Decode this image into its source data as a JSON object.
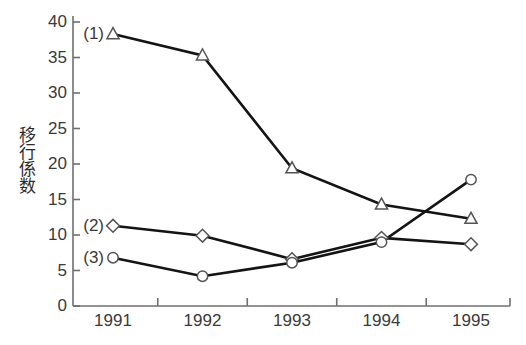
{
  "chart_data": {
    "type": "line",
    "title": "",
    "xlabel": "",
    "ylabel": "移行係数",
    "categories": [
      "1991",
      "1992",
      "1993",
      "1994",
      "1995"
    ],
    "ylim": [
      0,
      40
    ],
    "yticks": [
      0,
      5,
      10,
      15,
      20,
      25,
      30,
      35,
      40
    ],
    "ytick_labels": [
      "0",
      "5",
      "10",
      "15",
      "20",
      "25",
      "30",
      "35",
      "40"
    ],
    "grid": false,
    "legend_position": "inline-left",
    "series": [
      {
        "name": "(1)",
        "marker": "triangle",
        "values": [
          38.3,
          35.3,
          19.4,
          14.3,
          12.3
        ]
      },
      {
        "name": "(2)",
        "marker": "diamond",
        "values": [
          11.3,
          9.9,
          6.6,
          9.6,
          8.7
        ]
      },
      {
        "name": "(3)",
        "marker": "circle",
        "values": [
          6.8,
          4.2,
          6.1,
          9.0,
          17.8
        ]
      }
    ],
    "annotations": [
      {
        "text": "(1)",
        "series": "(1)",
        "at_category": "1991"
      },
      {
        "text": "(2)",
        "series": "(2)",
        "at_category": "1991"
      },
      {
        "text": "(3)",
        "series": "(3)",
        "at_category": "1991"
      }
    ],
    "colors": {
      "line": "#141414",
      "marker_fill": "#ffffff",
      "marker_stroke": "#555555",
      "axis": "#6f6f6f",
      "text": "#3a3a3a",
      "background": "#ffffff"
    }
  }
}
